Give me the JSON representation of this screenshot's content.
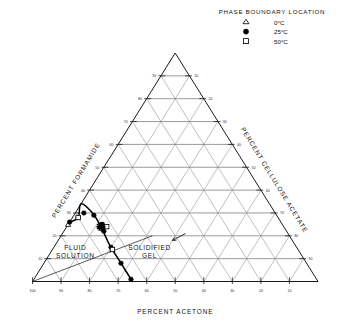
{
  "legend": {
    "title": "PHASE BOUNDARY LOCATION",
    "entries": [
      {
        "marker": "triangle-open-icon",
        "label": "0°C"
      },
      {
        "marker": "circle-filled-icon",
        "label": "25°C"
      },
      {
        "marker": "square-open-icon",
        "label": "50°C"
      }
    ]
  },
  "axes": {
    "bottom": {
      "title": "PERCENT ACETONE",
      "ticks": [
        "100",
        "90",
        "80",
        "70",
        "60",
        "50",
        "40",
        "30",
        "20",
        "10"
      ]
    },
    "left": {
      "title": "PERCENT FORMAMIDE",
      "ticks": [
        "10",
        "20",
        "30",
        "40",
        "50",
        "60",
        "70",
        "80",
        "90"
      ]
    },
    "right": {
      "title": "PERCENT CELLULOSE ACETATE",
      "ticks": [
        "10",
        "20",
        "30",
        "40",
        "50",
        "60",
        "70",
        "80",
        "90"
      ]
    }
  },
  "regions": {
    "fluid": "FLUID\nSOLUTION",
    "fluid_line1": "FLUID",
    "fluid_line2": "SOLUTION",
    "gel_line1": "SOLIDIFIED",
    "gel_line2": "GEL"
  },
  "chart_data": {
    "type": "scatter",
    "xlabel": "PERCENT ACETONE",
    "ylabel": "PERCENT FORMAMIDE",
    "zlabel": "PERCENT CELLULOSE ACETATE",
    "grid": true,
    "grid_interval": 10,
    "axis_range": [
      0,
      100
    ],
    "legend_position": "top-right",
    "components": [
      "acetone",
      "formamide",
      "cellulose acetate"
    ],
    "annotations": [
      {
        "text": "FLUID SOLUTION",
        "acetone": 78,
        "formamide": 14,
        "cellulose_acetate": 8
      },
      {
        "text": "SOLIDIFIED GEL",
        "acetone": 52,
        "formamide": 14,
        "cellulose_acetate": 34,
        "leader_to": {
          "acetone": 42,
          "formamide": 18,
          "cellulose_acetate": 40
        }
      }
    ],
    "boundary_curve": {
      "name": "phase boundary",
      "points": [
        {
          "acetone": 65,
          "formamide": 0,
          "cellulose_acetate": 35
        },
        {
          "acetone": 65,
          "formamide": 8,
          "cellulose_acetate": 27
        },
        {
          "acetone": 65,
          "formamide": 16,
          "cellulose_acetate": 19
        },
        {
          "acetone": 64,
          "formamide": 24,
          "cellulose_acetate": 12
        },
        {
          "acetone": 64,
          "formamide": 30,
          "cellulose_acetate": 6
        },
        {
          "acetone": 66,
          "formamide": 34,
          "cellulose_acetate": 0
        },
        {
          "acetone": 70,
          "formamide": 28,
          "cellulose_acetate": 2
        },
        {
          "acetone": 74,
          "formamide": 26,
          "cellulose_acetate": 0
        }
      ]
    },
    "series": [
      {
        "name": "0°C",
        "marker": "triangle-open",
        "values": [
          {
            "acetone": 75,
            "formamide": 25,
            "cellulose_acetate": 0
          },
          {
            "acetone": 65,
            "formamide": 14,
            "cellulose_acetate": 21
          }
        ]
      },
      {
        "name": "25°C",
        "marker": "circle-filled",
        "values": [
          {
            "acetone": 65,
            "formamide": 1,
            "cellulose_acetate": 34
          },
          {
            "acetone": 65,
            "formamide": 8,
            "cellulose_acetate": 27
          },
          {
            "acetone": 65,
            "formamide": 15,
            "cellulose_acetate": 20
          },
          {
            "acetone": 64,
            "formamide": 22,
            "cellulose_acetate": 14
          },
          {
            "acetone": 63,
            "formamide": 25,
            "cellulose_acetate": 12
          },
          {
            "acetone": 64,
            "formamide": 29,
            "cellulose_acetate": 7
          },
          {
            "acetone": 67,
            "formamide": 30,
            "cellulose_acetate": 3
          },
          {
            "acetone": 70,
            "formamide": 28,
            "cellulose_acetate": 2
          },
          {
            "acetone": 74,
            "formamide": 26,
            "cellulose_acetate": 0
          }
        ]
      },
      {
        "name": "50°C",
        "marker": "square-open",
        "values": [
          {
            "acetone": 62,
            "formamide": 24,
            "cellulose_acetate": 14
          },
          {
            "acetone": 65,
            "formamide": 14,
            "cellulose_acetate": 21
          },
          {
            "acetone": 70,
            "formamide": 28,
            "cellulose_acetate": 2
          }
        ]
      },
      {
        "name": "critical point",
        "marker": "star",
        "values": [
          {
            "acetone": 64,
            "formamide": 24,
            "cellulose_acetate": 12
          }
        ]
      }
    ]
  }
}
